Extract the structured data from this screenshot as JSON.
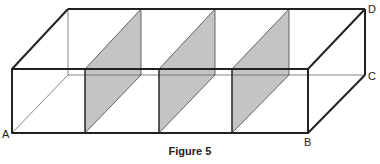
{
  "figure": {
    "caption": "Figure 5",
    "vertex_labels": {
      "A": "A",
      "B": "B",
      "C": "C",
      "D": "D"
    },
    "shaded_planes_count": 3,
    "colors": {
      "edge": "#222222",
      "hidden_edge": "#555555",
      "shade": "#c4c4c4"
    }
  }
}
